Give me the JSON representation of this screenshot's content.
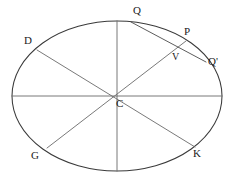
{
  "figure": {
    "kind": "geometry-diagram",
    "background_color": "#ffffff",
    "canvas": {
      "width": 235,
      "height": 179
    },
    "colors": {
      "ellipse_stroke": "#3a3a3a",
      "diameter_stroke": "#6a6a6a",
      "chord_stroke": "#4a4a4a",
      "label_text": "#1b1b1b"
    },
    "ellipse": {
      "center_x": 117,
      "center_y": 96,
      "semi_major_a": 105,
      "semi_minor_b": 75
    },
    "points": [
      {
        "id": "Q",
        "label": "Q",
        "x": 131,
        "y": 22,
        "label_x": 133,
        "label_y": 5,
        "size": "normal"
      },
      {
        "id": "P",
        "label": "P",
        "x": 186,
        "y": 41,
        "label_x": 184,
        "label_y": 26,
        "size": "normal"
      },
      {
        "id": "Qp",
        "label": "Q'",
        "x": 206,
        "y": 62,
        "label_x": 208,
        "label_y": 56,
        "size": "normal"
      },
      {
        "id": "V",
        "label": "V",
        "x": 177,
        "y": 48,
        "label_x": 172,
        "label_y": 52,
        "size": "small"
      },
      {
        "id": "D",
        "label": "D",
        "x": 37,
        "y": 50,
        "label_x": 24,
        "label_y": 35,
        "size": "normal"
      },
      {
        "id": "C",
        "label": "C",
        "x": 117,
        "y": 96,
        "label_x": 116,
        "label_y": 98,
        "size": "normal"
      },
      {
        "id": "G",
        "label": "G",
        "x": 47,
        "y": 148,
        "label_x": 31,
        "label_y": 150,
        "size": "normal"
      },
      {
        "id": "K",
        "label": "K",
        "x": 195,
        "y": 147,
        "label_x": 193,
        "label_y": 148,
        "size": "normal"
      }
    ],
    "diameters": [
      {
        "id": "horizontal-axis",
        "name": "major-axis",
        "x1": 12,
        "y1": 96,
        "x2": 222,
        "y2": 96
      },
      {
        "id": "vertical-axis",
        "name": "minor-axis",
        "x1": 117,
        "y1": 21,
        "x2": 117,
        "y2": 171
      },
      {
        "id": "diameter-DK",
        "name": "diameter-D-to-K",
        "x1": 37,
        "y1": 50,
        "x2": 195,
        "y2": 147
      },
      {
        "id": "diameter-GP",
        "name": "diameter-G-to-P",
        "x1": 47,
        "y1": 148,
        "x2": 186,
        "y2": 41
      }
    ],
    "chords": [
      {
        "id": "chord-QQp",
        "name": "chord-Q-to-Qprime",
        "x1": 131,
        "y1": 22,
        "x2": 206,
        "y2": 62
      }
    ]
  }
}
